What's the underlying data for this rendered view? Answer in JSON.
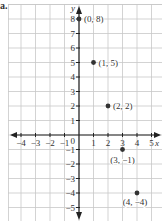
{
  "part_label": "a.",
  "colors": {
    "grid": "#c8c8c8",
    "axis": "#222222",
    "point": "#333333",
    "text": "#333333"
  },
  "chart_data": {
    "type": "scatter",
    "title": "",
    "xlabel": "x",
    "ylabel": "y",
    "xlim": [
      -5,
      5.5
    ],
    "ylim": [
      -5.5,
      8.5
    ],
    "grid": true,
    "x_ticks": [
      -4,
      -3,
      -2,
      -1,
      1,
      2,
      3,
      4,
      5
    ],
    "y_ticks": [
      -5,
      -4,
      -3,
      -2,
      -1,
      1,
      2,
      3,
      4,
      5,
      6,
      7,
      8
    ],
    "origin_label": "0",
    "points": [
      {
        "x": 0,
        "y": 8,
        "label": "(0, 8)"
      },
      {
        "x": 1,
        "y": 5,
        "label": "(1, 5)"
      },
      {
        "x": 2,
        "y": 2,
        "label": "(2, 2)"
      },
      {
        "x": 3,
        "y": -1,
        "label": "(3, −1)"
      },
      {
        "x": 4,
        "y": -4,
        "label": "(4, −4)"
      }
    ]
  }
}
